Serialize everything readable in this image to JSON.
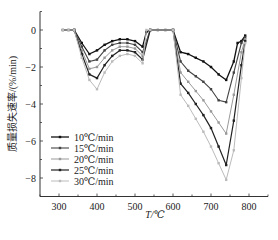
{
  "chart_data": {
    "type": "line",
    "title": "",
    "xlabel": "T/℃",
    "ylabel": "质量损失速率/(%/min)",
    "xlim": [
      250,
      850
    ],
    "ylim": [
      -9,
      1
    ],
    "xticks": [
      300,
      400,
      500,
      600,
      700,
      800
    ],
    "yticks": [
      0,
      -2,
      -4,
      -6,
      -8
    ],
    "grid": false,
    "legend_position": "lower-left inside",
    "series": [
      {
        "name": "10℃/min",
        "color": "#111111",
        "width": 1.3,
        "x": [
          310,
          325,
          340,
          360,
          380,
          400,
          420,
          440,
          460,
          480,
          500,
          520,
          530,
          540,
          560,
          580,
          600,
          620,
          640,
          660,
          680,
          700,
          720,
          740,
          760,
          770,
          780,
          790
        ],
        "y": [
          0,
          0,
          0,
          -0.7,
          -1.3,
          -1.1,
          -0.8,
          -0.6,
          -0.5,
          -0.5,
          -0.6,
          -0.9,
          -0.1,
          0,
          0,
          0,
          0,
          -1.2,
          -1.3,
          -1.5,
          -1.7,
          -2.0,
          -2.4,
          -2.7,
          -1.7,
          -0.7,
          -0.6,
          -0.3
        ]
      },
      {
        "name": "15℃/min",
        "color": "#444444",
        "width": 1.1,
        "x": [
          340,
          360,
          380,
          400,
          420,
          440,
          460,
          480,
          500,
          520,
          540,
          600,
          620,
          640,
          660,
          680,
          700,
          720,
          740,
          760,
          780,
          790
        ],
        "y": [
          0,
          -0.9,
          -1.7,
          -1.6,
          -1.1,
          -0.8,
          -0.7,
          -0.7,
          -0.8,
          -1.2,
          0,
          0,
          -1.7,
          -2.2,
          -2.5,
          -2.8,
          -3.2,
          -3.8,
          -3.9,
          -2.3,
          -0.7,
          -0.4
        ]
      },
      {
        "name": "20℃/min",
        "color": "#999999",
        "width": 1.0,
        "x": [
          340,
          360,
          380,
          400,
          420,
          440,
          460,
          480,
          500,
          520,
          540,
          600,
          620,
          640,
          660,
          680,
          700,
          720,
          740,
          760,
          780,
          790
        ],
        "y": [
          0,
          -1.1,
          -2.1,
          -2.0,
          -1.5,
          -1.1,
          -0.9,
          -0.9,
          -1.0,
          -1.4,
          0,
          0,
          -2.3,
          -2.8,
          -3.3,
          -3.8,
          -4.4,
          -5.0,
          -5.6,
          -3.5,
          -1.2,
          -0.5
        ]
      },
      {
        "name": "25℃/min",
        "color": "#222222",
        "width": 1.2,
        "x": [
          340,
          360,
          380,
          400,
          420,
          440,
          460,
          480,
          500,
          520,
          540,
          600,
          620,
          640,
          660,
          680,
          700,
          720,
          740,
          760,
          780,
          790
        ],
        "y": [
          0,
          -1.3,
          -2.4,
          -2.6,
          -1.9,
          -1.4,
          -1.1,
          -1.1,
          -1.2,
          -1.6,
          0,
          0,
          -2.9,
          -3.4,
          -4.0,
          -4.6,
          -5.3,
          -6.3,
          -7.3,
          -4.9,
          -1.9,
          -0.6
        ]
      },
      {
        "name": "30℃/min",
        "color": "#bbbbbb",
        "width": 1.0,
        "x": [
          310,
          325,
          340,
          360,
          380,
          400,
          420,
          440,
          460,
          480,
          500,
          520,
          530,
          540,
          600,
          620,
          640,
          660,
          680,
          700,
          720,
          740,
          760,
          780,
          790
        ],
        "y": [
          0,
          0,
          0,
          -1.5,
          -2.7,
          -3.2,
          -2.3,
          -1.7,
          -1.4,
          -1.3,
          -1.4,
          -1.8,
          0,
          0,
          0,
          -3.5,
          -4.1,
          -4.8,
          -5.5,
          -6.3,
          -7.2,
          -8.1,
          -6.5,
          -2.6,
          -0.7
        ]
      }
    ]
  }
}
